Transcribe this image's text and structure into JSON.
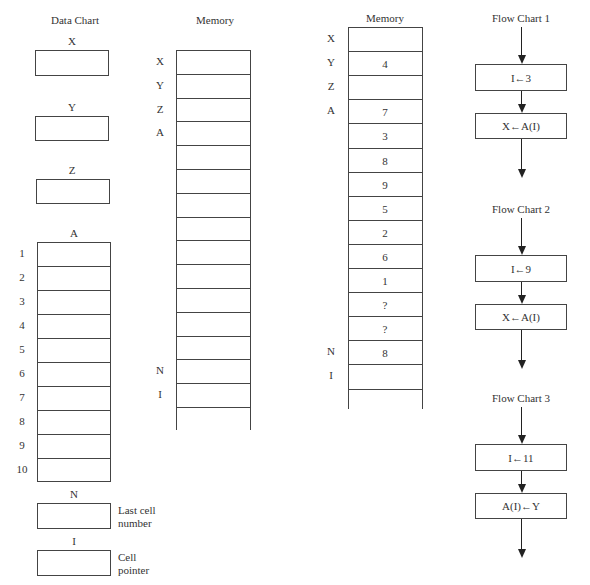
{
  "data_chart": {
    "title": "Data Chart",
    "scalars": [
      {
        "name": "X",
        "value": ""
      },
      {
        "name": "Y",
        "value": ""
      },
      {
        "name": "Z",
        "value": ""
      }
    ],
    "array": {
      "name": "A",
      "indices": [
        "1",
        "2",
        "3",
        "4",
        "5",
        "6",
        "7",
        "8",
        "9",
        "10"
      ],
      "values": [
        "",
        "",
        "",
        "",
        "",
        "",
        "",
        "",
        "",
        ""
      ]
    },
    "n": {
      "name": "N",
      "value": "",
      "description_line1": "Last cell",
      "description_line2": "number"
    },
    "i": {
      "name": "I",
      "value": "",
      "description_line1": "Cell",
      "description_line2": "pointer"
    }
  },
  "memory_empty": {
    "title": "Memory",
    "cells": [
      {
        "label": "X",
        "value": ""
      },
      {
        "label": "Y",
        "value": ""
      },
      {
        "label": "Z",
        "value": ""
      },
      {
        "label": "A",
        "value": ""
      },
      {
        "label": "",
        "value": ""
      },
      {
        "label": "",
        "value": ""
      },
      {
        "label": "",
        "value": ""
      },
      {
        "label": "",
        "value": ""
      },
      {
        "label": "",
        "value": ""
      },
      {
        "label": "",
        "value": ""
      },
      {
        "label": "",
        "value": ""
      },
      {
        "label": "",
        "value": ""
      },
      {
        "label": "",
        "value": ""
      },
      {
        "label": "N",
        "value": ""
      },
      {
        "label": "I",
        "value": ""
      }
    ]
  },
  "memory_filled": {
    "title": "Memory",
    "cells": [
      {
        "label": "X",
        "value": ""
      },
      {
        "label": "Y",
        "value": "4"
      },
      {
        "label": "Z",
        "value": ""
      },
      {
        "label": "A",
        "value": "7"
      },
      {
        "label": "",
        "value": "3"
      },
      {
        "label": "",
        "value": "8"
      },
      {
        "label": "",
        "value": "9"
      },
      {
        "label": "",
        "value": "5"
      },
      {
        "label": "",
        "value": "2"
      },
      {
        "label": "",
        "value": "6"
      },
      {
        "label": "",
        "value": "1"
      },
      {
        "label": "",
        "value": "?"
      },
      {
        "label": "",
        "value": "?"
      },
      {
        "label": "N",
        "value": "8"
      },
      {
        "label": "I",
        "value": ""
      }
    ]
  },
  "flow_charts": [
    {
      "title": "Flow Chart 1",
      "steps": [
        "I←3",
        "X←A(I)"
      ]
    },
    {
      "title": "Flow Chart 2",
      "steps": [
        "I←9",
        "X←A(I)"
      ]
    },
    {
      "title": "Flow Chart 3",
      "steps": [
        "I←11",
        "A(I)←Y"
      ]
    }
  ]
}
